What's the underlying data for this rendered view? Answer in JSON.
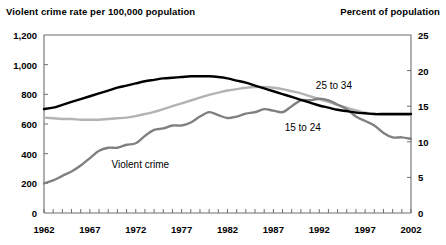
{
  "header": {
    "left_axis_title": "Violent crime rate per 100,000 population",
    "right_axis_title": "Percent of population"
  },
  "chart_data": {
    "type": "line",
    "title": "",
    "subtitle": "",
    "xlabel": "",
    "ylabel": "Violent crime rate per 100,000 population",
    "y2label": "Percent of population",
    "grid": false,
    "legend": "inline-annotations",
    "xlim": [
      1962,
      2002
    ],
    "ylim": [
      0,
      1200
    ],
    "y2lim": [
      0,
      25
    ],
    "x_tick_labels": [
      "1962",
      "1967",
      "1972",
      "1977",
      "1982",
      "1987",
      "1992",
      "1997",
      "2002"
    ],
    "x_ticks": [
      1962,
      1967,
      1972,
      1977,
      1982,
      1987,
      1992,
      1997,
      2002
    ],
    "y_tick_labels": [
      "0",
      "200",
      "400",
      "600",
      "800",
      "1,000",
      "1,200"
    ],
    "y_ticks": [
      0,
      200,
      400,
      600,
      800,
      1000,
      1200
    ],
    "y2_tick_labels": [
      "0",
      "5",
      "10",
      "15",
      "20",
      "25"
    ],
    "y2_ticks": [
      0,
      5,
      10,
      15,
      20,
      25
    ],
    "minor_x_ticks_every": 1,
    "x": [
      1962,
      1963,
      1964,
      1965,
      1966,
      1967,
      1968,
      1969,
      1970,
      1971,
      1972,
      1973,
      1974,
      1975,
      1976,
      1977,
      1978,
      1979,
      1980,
      1981,
      1982,
      1983,
      1984,
      1985,
      1986,
      1987,
      1988,
      1989,
      1990,
      1991,
      1992,
      1993,
      1994,
      1995,
      1996,
      1997,
      1998,
      1999,
      2000,
      2001,
      2002
    ],
    "series": [
      {
        "name": "15 to 24",
        "label": "15 to 24",
        "axis": "right",
        "color": "#000000",
        "width": 2.4,
        "label_x": 1990.2,
        "label_y_pct": 12.1,
        "values": [
          14.6,
          14.8,
          15.2,
          15.6,
          16.0,
          16.4,
          16.8,
          17.2,
          17.6,
          17.9,
          18.2,
          18.5,
          18.7,
          18.9,
          19.0,
          19.1,
          19.2,
          19.2,
          19.2,
          19.1,
          18.9,
          18.6,
          18.3,
          17.9,
          17.5,
          17.1,
          16.7,
          16.3,
          15.9,
          15.5,
          15.1,
          14.8,
          14.5,
          14.3,
          14.1,
          14.0,
          13.9,
          13.9,
          13.9,
          13.9,
          13.9
        ]
      },
      {
        "name": "25 to 34",
        "label": "25 to 34",
        "axis": "right",
        "color": "#b3b3b3",
        "width": 2.4,
        "label_x": 1993.6,
        "label_y_pct": 18.0,
        "values": [
          13.4,
          13.3,
          13.2,
          13.2,
          13.1,
          13.1,
          13.1,
          13.2,
          13.3,
          13.4,
          13.6,
          13.9,
          14.2,
          14.6,
          15.0,
          15.4,
          15.8,
          16.2,
          16.6,
          16.9,
          17.2,
          17.4,
          17.6,
          17.7,
          17.7,
          17.6,
          17.4,
          17.1,
          16.8,
          16.4,
          16.0,
          15.6,
          15.2,
          14.8,
          14.4,
          14.1,
          13.9,
          13.8,
          13.8,
          13.8,
          13.8
        ]
      },
      {
        "name": "Violent crime",
        "label": "Violent crime",
        "axis": "left",
        "color": "#808080",
        "width": 2.4,
        "label_x": 1972.5,
        "label_y_rate": 330,
        "values": [
          200,
          220,
          250,
          280,
          320,
          370,
          420,
          440,
          440,
          460,
          470,
          520,
          560,
          570,
          590,
          590,
          610,
          650,
          680,
          660,
          640,
          650,
          670,
          680,
          700,
          690,
          680,
          720,
          760,
          760,
          770,
          760,
          730,
          700,
          650,
          620,
          590,
          540,
          510,
          510,
          500
        ]
      }
    ],
    "annotations": [
      {
        "text": "Violent crime",
        "x": 1972.5,
        "y": 330,
        "axis": "left"
      },
      {
        "text": "15 to 24",
        "x": 1990.2,
        "y": 12.1,
        "axis": "right"
      },
      {
        "text": "25 to 34",
        "x": 1993.6,
        "y": 18.0,
        "axis": "right"
      }
    ]
  },
  "colors": {
    "series_black": "#000000",
    "series_light_gray": "#b3b3b3",
    "series_mid_gray": "#808080",
    "axis": "#6e6e6e",
    "background": "#ffffff",
    "text": "#000000"
  }
}
